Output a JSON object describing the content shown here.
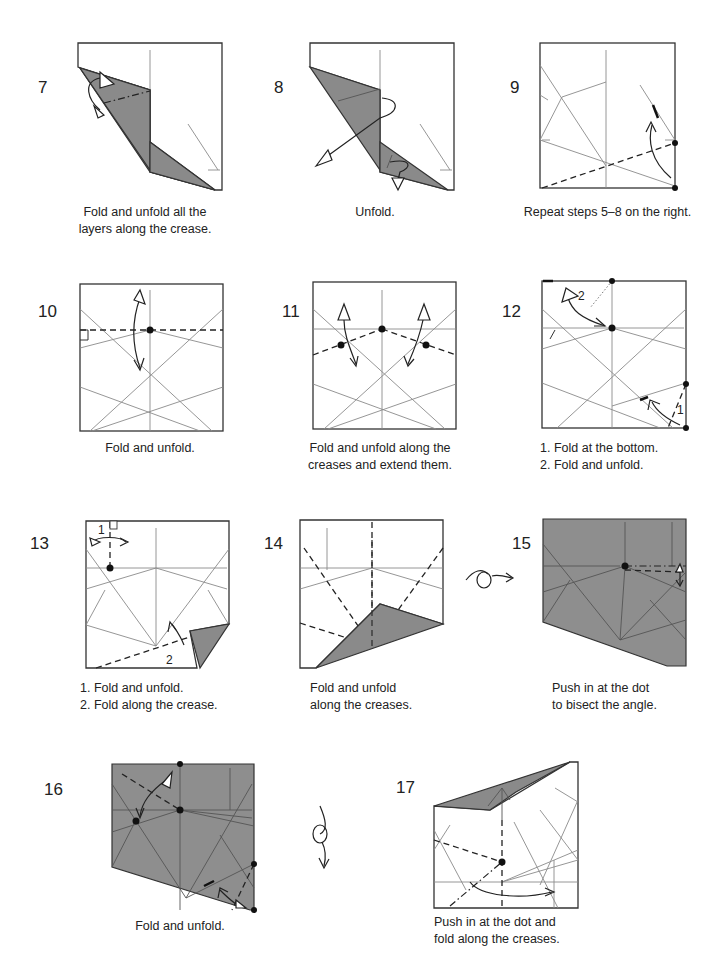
{
  "page": {
    "paper_colors": {
      "white_side": "#ffffff",
      "colored_side": "#8a8a8a",
      "line": "#333333"
    }
  },
  "steps": [
    {
      "number": "7",
      "caption": "Fold and unfold all the\nlayers along the crease."
    },
    {
      "number": "8",
      "caption": "Unfold."
    },
    {
      "number": "9",
      "caption": "Repeat steps 5–8 on the right."
    },
    {
      "number": "10",
      "caption": "Fold and unfold."
    },
    {
      "number": "11",
      "caption": "Fold and unfold along the\ncreases and extend them."
    },
    {
      "number": "12",
      "caption": "1. Fold at the bottom.\n2. Fold and unfold.",
      "labels": [
        "1",
        "2"
      ]
    },
    {
      "number": "13",
      "caption": "1. Fold and unfold.\n2. Fold along the crease.",
      "labels": [
        "1",
        "2"
      ]
    },
    {
      "number": "14",
      "caption": "Fold and unfold\nalong the creases."
    },
    {
      "number": "15",
      "caption": "Push in at the dot\nto bisect the angle."
    },
    {
      "number": "16",
      "caption": "Fold and unfold."
    },
    {
      "number": "17",
      "caption": "Push in at the dot and\nfold along the creases."
    }
  ],
  "symbols": {
    "turn_over_horizontal": "turn-over-icon",
    "turn_over_vertical": "rotate-icon"
  }
}
